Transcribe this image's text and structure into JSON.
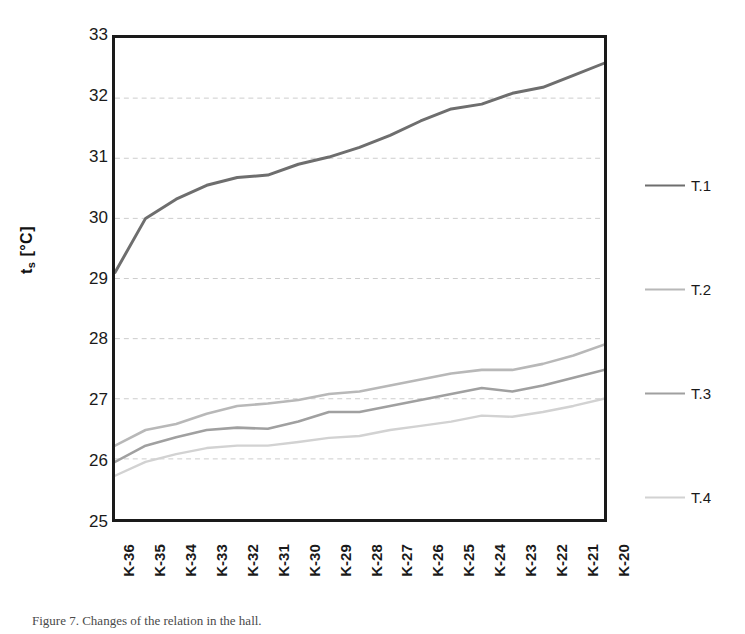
{
  "chart_data": {
    "type": "line",
    "title": "",
    "xlabel": "",
    "ylabel": "t_s [°C]",
    "ylabel_main": "t",
    "ylabel_sub": "s",
    "ylabel_unit": " [°C]",
    "categories": [
      "K-36",
      "K-35",
      "K-34",
      "K-33",
      "K-32",
      "K-31",
      "K-30",
      "K-29",
      "K-28",
      "K-27",
      "K-26",
      "K-25",
      "K-24",
      "K-23",
      "K-22",
      "K-21",
      "K-20"
    ],
    "ylim": [
      25,
      33
    ],
    "yticks": [
      25,
      26,
      27,
      28,
      29,
      30,
      31,
      32,
      33
    ],
    "ytick_labels": [
      "25",
      "26",
      "27",
      "28",
      "29",
      "30",
      "31",
      "32",
      "33"
    ],
    "grid": true,
    "grid_style": "dashed-horizontal-light",
    "legend_position": "right",
    "series": [
      {
        "name": "T.1",
        "color": "#6e6e6e",
        "width": 3.0,
        "values": [
          29.1,
          30.0,
          30.32,
          30.55,
          30.68,
          30.72,
          30.9,
          31.02,
          31.18,
          31.38,
          31.62,
          31.82,
          31.9,
          32.08,
          32.18,
          32.38,
          32.58
        ]
      },
      {
        "name": "T.2",
        "color": "#b8b8b8",
        "width": 2.6,
        "values": [
          26.22,
          26.48,
          26.58,
          26.75,
          26.88,
          26.92,
          26.98,
          27.08,
          27.12,
          27.22,
          27.32,
          27.42,
          27.48,
          27.48,
          27.58,
          27.72,
          27.9
        ]
      },
      {
        "name": "T.3",
        "color": "#a0a0a0",
        "width": 2.6,
        "values": [
          25.95,
          26.22,
          26.36,
          26.48,
          26.52,
          26.5,
          26.62,
          26.78,
          26.78,
          26.88,
          26.98,
          27.08,
          27.18,
          27.12,
          27.22,
          27.35,
          27.48
        ]
      },
      {
        "name": "T.4",
        "color": "#d2d2d2",
        "width": 2.4,
        "values": [
          25.72,
          25.95,
          26.08,
          26.18,
          26.22,
          26.22,
          26.28,
          26.35,
          26.38,
          26.48,
          26.55,
          26.62,
          26.72,
          26.7,
          26.78,
          26.88,
          27.0
        ]
      }
    ]
  },
  "legend": {
    "entries": [
      {
        "label": "T.1",
        "color": "#6e6e6e"
      },
      {
        "label": "T.2",
        "color": "#b8b8b8"
      },
      {
        "label": "T.3",
        "color": "#a0a0a0"
      },
      {
        "label": "T.4",
        "color": "#d2d2d2"
      }
    ]
  },
  "caption": {
    "text": "Figure 7. Changes of the relation in the hall."
  },
  "colors": {
    "axis": "#1a1a1a",
    "grid": "#cccccc",
    "background": "#ffffff",
    "text": "#1a1a1a"
  }
}
